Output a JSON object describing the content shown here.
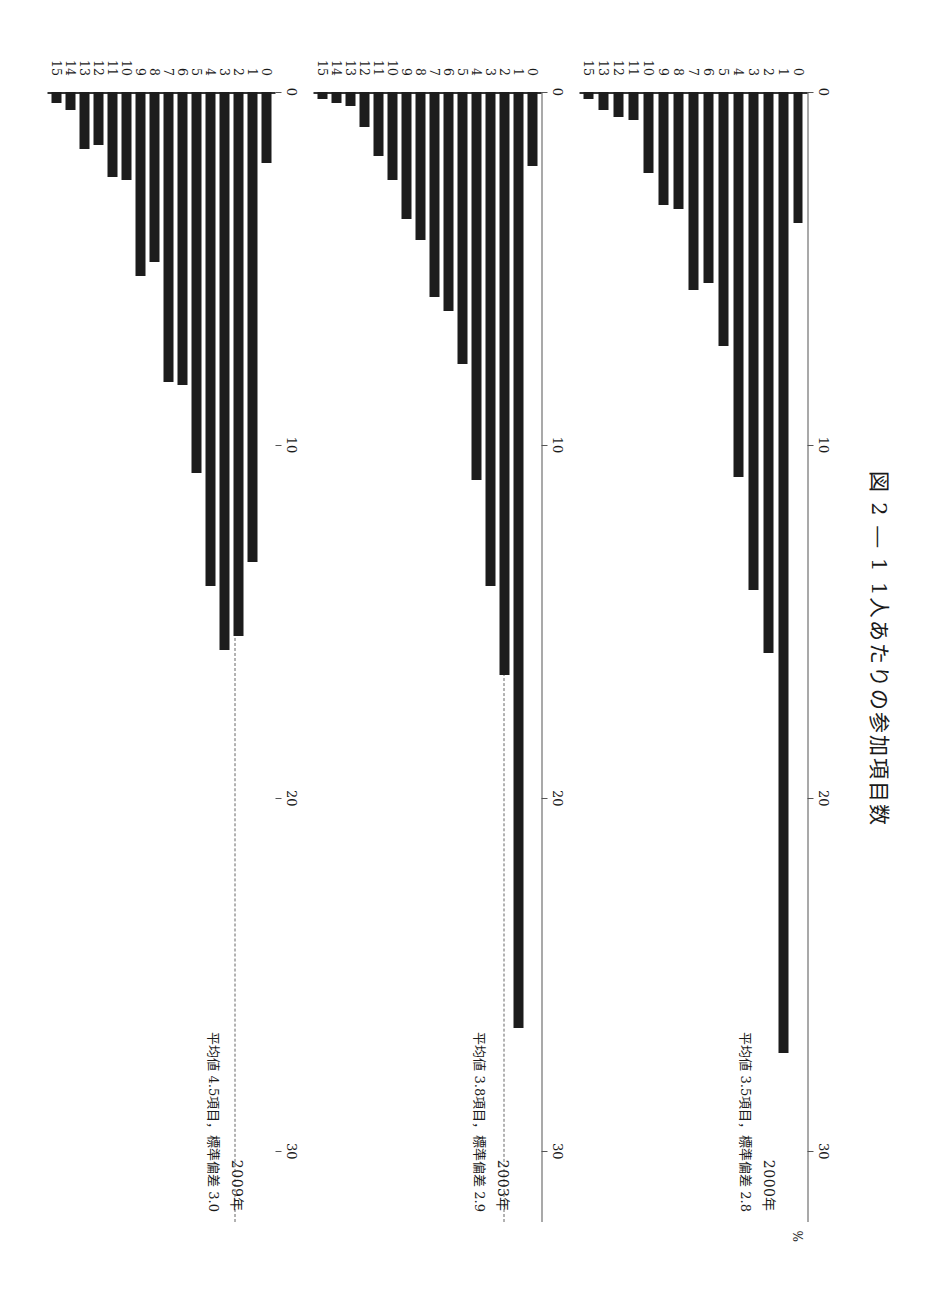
{
  "figure": {
    "title": "図 2 ― 1   1人あたりの参加項目数",
    "unit_label": "%"
  },
  "chart_data": {
    "type": "bar",
    "orientation": "horizontal",
    "title": "図 2 ― 1   1人あたりの参加項目数",
    "xlabel": "%",
    "ylabel": "",
    "xlim": [
      0,
      32
    ],
    "xticks": [
      0,
      10,
      20,
      30
    ],
    "xtick_labels": [
      "0",
      "10",
      "20",
      "30"
    ],
    "grid": false,
    "panels": [
      {
        "year_label": "2000年",
        "annotation": "平均値 3.5項目，標準偏差 2.8",
        "mean": 3.5,
        "sd": 2.8,
        "categories": [
          "0",
          "1",
          "2",
          "3",
          "4",
          "5",
          "6",
          "7",
          "8",
          "9",
          "10",
          "11",
          "12",
          "13",
          "15"
        ],
        "values": [
          3.7,
          27.2,
          15.9,
          14.1,
          10.9,
          7.2,
          5.4,
          5.6,
          3.3,
          3.2,
          2.3,
          0.8,
          0.7,
          0.5,
          0.2
        ]
      },
      {
        "year_label": "2003年",
        "annotation": "平均値 3.8項目，標準偏差 2.9",
        "mean": 3.8,
        "sd": 2.9,
        "categories": [
          "0",
          "1",
          "2",
          "3",
          "4",
          "5",
          "6",
          "7",
          "8",
          "9",
          "10",
          "11",
          "12",
          "13",
          "14",
          "15"
        ],
        "values": [
          2.1,
          26.5,
          16.5,
          14.0,
          11.0,
          7.7,
          6.2,
          5.8,
          4.2,
          3.6,
          2.5,
          1.8,
          1.0,
          0.4,
          0.3,
          0.2
        ]
      },
      {
        "year_label": "2009年",
        "annotation": "平均値 4.5項目，標準偏差 3.0",
        "mean": 4.5,
        "sd": 3.0,
        "categories": [
          "0",
          "1",
          "2",
          "3",
          "4",
          "5",
          "6",
          "7",
          "8",
          "9",
          "10",
          "11",
          "12",
          "13",
          "14",
          "15"
        ],
        "values": [
          2.0,
          13.3,
          15.4,
          15.8,
          14.0,
          10.8,
          8.3,
          8.2,
          4.8,
          5.2,
          2.5,
          2.4,
          1.5,
          1.6,
          0.5,
          0.3
        ]
      }
    ]
  }
}
